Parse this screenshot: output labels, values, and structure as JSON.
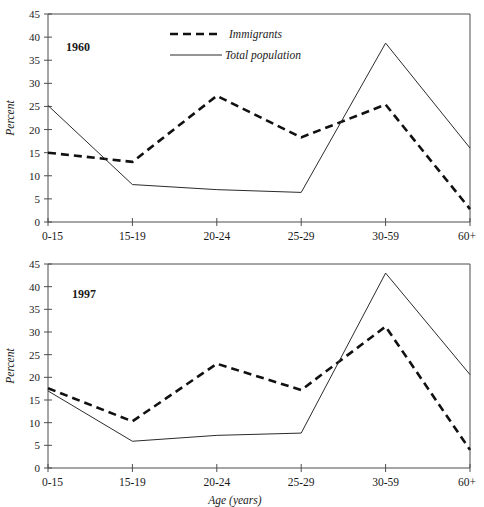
{
  "figure": {
    "background_color": "#ffffff",
    "ink_color": "#1a1a1a"
  },
  "legend": {
    "immigrants_label": "Immigrants",
    "total_population_label": "Total population",
    "position": "top-center-left"
  },
  "axis": {
    "y_title": "Percent",
    "x_title": "Age (years)",
    "y_ticks": [
      "0",
      "5",
      "10",
      "15",
      "20",
      "25",
      "30",
      "35",
      "40",
      "45"
    ],
    "x_categories": [
      "0-15",
      "15-19",
      "20-24",
      "25-29",
      "30-59",
      "60+"
    ]
  },
  "panels": [
    {
      "id": "panel-1960",
      "year_label": "1960"
    },
    {
      "id": "panel-1997",
      "year_label": "1997"
    }
  ],
  "chart_data": [
    {
      "type": "line",
      "title": "1960",
      "xlabel": "",
      "ylabel": "Percent",
      "categories": [
        "0-15",
        "15-19",
        "20-24",
        "25-29",
        "30-59",
        "60+"
      ],
      "ylim": [
        0,
        45
      ],
      "ytick_step": 5,
      "grid": false,
      "legend_position": "upper center",
      "series": [
        {
          "name": "Immigrants",
          "style": "dashed",
          "color": "#111111",
          "values": [
            15.0,
            13.0,
            27.3,
            18.3,
            25.4,
            2.8
          ]
        },
        {
          "name": "Total population",
          "style": "solid",
          "color": "#2b2b2b",
          "values": [
            25.2,
            8.1,
            7.0,
            6.4,
            38.7,
            16.0
          ]
        }
      ]
    },
    {
      "type": "line",
      "title": "1997",
      "xlabel": "Age (years)",
      "ylabel": "Percent",
      "categories": [
        "0-15",
        "15-19",
        "20-24",
        "25-29",
        "30-59",
        "60+"
      ],
      "ylim": [
        0,
        45
      ],
      "ytick_step": 5,
      "grid": false,
      "legend_position": "none",
      "series": [
        {
          "name": "Immigrants",
          "style": "dashed",
          "color": "#111111",
          "values": [
            17.6,
            10.3,
            23.0,
            17.2,
            31.2,
            4.0
          ]
        },
        {
          "name": "Total population",
          "style": "solid",
          "color": "#2b2b2b",
          "values": [
            17.0,
            5.9,
            7.2,
            7.7,
            43.0,
            20.6
          ]
        }
      ]
    }
  ]
}
